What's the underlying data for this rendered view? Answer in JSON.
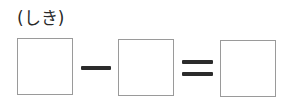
{
  "label": "(しき)",
  "equation": {
    "operator": "−",
    "equals": "=",
    "boxes": [
      "",
      "",
      ""
    ]
  }
}
